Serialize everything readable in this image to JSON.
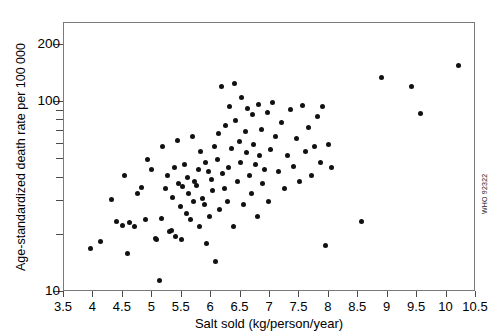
{
  "chart": {
    "title": "",
    "credit": "WHO 92322"
  },
  "chart_data": {
    "type": "scatter",
    "title": "",
    "subtitle": "",
    "xlabel": "Salt sold (kg/person/year)",
    "ylabel": "Age-standardized death rate per 100 000",
    "xlim": [
      3.5,
      10.5
    ],
    "ylim": [
      10,
      260
    ],
    "yscale": "log",
    "xscale": "linear",
    "grid": false,
    "legend": null,
    "xticks": [
      3.5,
      4,
      4.5,
      5,
      5.5,
      6,
      6.5,
      7,
      7.5,
      8,
      8.5,
      9,
      9.5,
      10,
      10.5
    ],
    "xticklabels": [
      "3.5",
      "4",
      "4.5",
      "5",
      "5.5",
      "6",
      "6.5",
      "7",
      "7.5",
      "8",
      "8.5",
      "9",
      "9.5",
      "10",
      "10.5"
    ],
    "yticks": [
      10,
      20,
      30,
      40,
      50,
      60,
      70,
      80,
      90,
      100,
      200
    ],
    "yticklabels": [
      "10",
      "",
      "",
      "",
      "",
      "",
      "",
      "",
      "",
      "100",
      "200"
    ],
    "marker": "filled-circle",
    "marker_color": "#111111",
    "marker_size": 5,
    "series": [
      {
        "name": "Countries",
        "points": [
          [
            3.95,
            17.0
          ],
          [
            4.12,
            18.4
          ],
          [
            4.3,
            30.5
          ],
          [
            4.4,
            23.5
          ],
          [
            4.5,
            22.3
          ],
          [
            4.52,
            41.0
          ],
          [
            4.58,
            16.0
          ],
          [
            4.62,
            23.2
          ],
          [
            4.7,
            22.0
          ],
          [
            4.75,
            33.0
          ],
          [
            4.82,
            35.5
          ],
          [
            4.88,
            24.0
          ],
          [
            4.92,
            50.0
          ],
          [
            4.98,
            44.0
          ],
          [
            5.05,
            19.2
          ],
          [
            5.08,
            19.0
          ],
          [
            5.12,
            11.5
          ],
          [
            5.15,
            24.5
          ],
          [
            5.18,
            58.0
          ],
          [
            5.22,
            35.0
          ],
          [
            5.25,
            41.0
          ],
          [
            5.3,
            20.8
          ],
          [
            5.32,
            21.0
          ],
          [
            5.35,
            31.5
          ],
          [
            5.38,
            45.0
          ],
          [
            5.4,
            19.5
          ],
          [
            5.42,
            63.0
          ],
          [
            5.45,
            37.0
          ],
          [
            5.48,
            28.0
          ],
          [
            5.5,
            19.0
          ],
          [
            5.52,
            36.0
          ],
          [
            5.55,
            47.0
          ],
          [
            5.58,
            26.0
          ],
          [
            5.6,
            40.0
          ],
          [
            5.62,
            33.0
          ],
          [
            5.65,
            24.0
          ],
          [
            5.68,
            66.0
          ],
          [
            5.7,
            30.0
          ],
          [
            5.72,
            38.0
          ],
          [
            5.75,
            36.5
          ],
          [
            5.78,
            44.0
          ],
          [
            5.8,
            22.0
          ],
          [
            5.82,
            55.0
          ],
          [
            5.85,
            31.0
          ],
          [
            5.88,
            29.0
          ],
          [
            5.9,
            48.0
          ],
          [
            5.92,
            18.0
          ],
          [
            5.95,
            43.0
          ],
          [
            5.98,
            25.0
          ],
          [
            6.0,
            39.0
          ],
          [
            6.02,
            34.0
          ],
          [
            6.05,
            58.0
          ],
          [
            6.08,
            14.5
          ],
          [
            6.1,
            50.0
          ],
          [
            6.12,
            68.0
          ],
          [
            6.15,
            27.0
          ],
          [
            6.18,
            120.0
          ],
          [
            6.2,
            42.0
          ],
          [
            6.22,
            35.0
          ],
          [
            6.25,
            75.0
          ],
          [
            6.28,
            30.0
          ],
          [
            6.3,
            45.0
          ],
          [
            6.32,
            95.0
          ],
          [
            6.35,
            57.0
          ],
          [
            6.38,
            22.0
          ],
          [
            6.4,
            125.0
          ],
          [
            6.42,
            80.0
          ],
          [
            6.45,
            38.0
          ],
          [
            6.48,
            62.0
          ],
          [
            6.5,
            48.0
          ],
          [
            6.52,
            105.0
          ],
          [
            6.55,
            29.0
          ],
          [
            6.58,
            70.0
          ],
          [
            6.6,
            54.0
          ],
          [
            6.62,
            92.0
          ],
          [
            6.65,
            41.0
          ],
          [
            6.68,
            33.0
          ],
          [
            6.7,
            86.0
          ],
          [
            6.72,
            60.0
          ],
          [
            6.75,
            47.0
          ],
          [
            6.78,
            25.0
          ],
          [
            6.8,
            97.0
          ],
          [
            6.82,
            52.0
          ],
          [
            6.85,
            72.0
          ],
          [
            6.88,
            37.0
          ],
          [
            6.9,
            44.0
          ],
          [
            6.95,
            88.0
          ],
          [
            6.98,
            30.0
          ],
          [
            7.0,
            56.0
          ],
          [
            7.05,
            99.0
          ],
          [
            7.1,
            66.0
          ],
          [
            7.15,
            43.0
          ],
          [
            7.2,
            78.0
          ],
          [
            7.25,
            35.0
          ],
          [
            7.3,
            52.0
          ],
          [
            7.35,
            91.0
          ],
          [
            7.4,
            46.0
          ],
          [
            7.45,
            64.0
          ],
          [
            7.5,
            38.0
          ],
          [
            7.55,
            96.0
          ],
          [
            7.6,
            55.0
          ],
          [
            7.65,
            73.0
          ],
          [
            7.7,
            41.0
          ],
          [
            7.75,
            58.0
          ],
          [
            7.8,
            84.0
          ],
          [
            7.85,
            48.0
          ],
          [
            7.9,
            95.0
          ],
          [
            7.95,
            17.5
          ],
          [
            8.0,
            60.0
          ],
          [
            8.05,
            45.0
          ],
          [
            8.55,
            23.5
          ],
          [
            8.9,
            135.0
          ],
          [
            9.4,
            120.0
          ],
          [
            9.55,
            87.0
          ],
          [
            10.2,
            155.0
          ]
        ]
      }
    ]
  }
}
